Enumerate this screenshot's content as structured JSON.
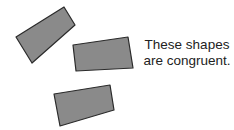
{
  "caption": {
    "line1": "These shapes",
    "line2": "are congruent."
  },
  "colors": {
    "shape_fill": "#8a8a8a",
    "shape_stroke": "#2a2a2a",
    "text": "#222222",
    "background": "#ffffff"
  },
  "shapes": [
    {
      "name": "quadrilateral-1",
      "points": "64,7 75,25 32,63 16,37"
    },
    {
      "name": "quadrilateral-2",
      "points": "73,45 128,37 133,68 76,71"
    },
    {
      "name": "quadrilateral-3",
      "points": "54,94 110,85 114,110 60,126"
    }
  ]
}
